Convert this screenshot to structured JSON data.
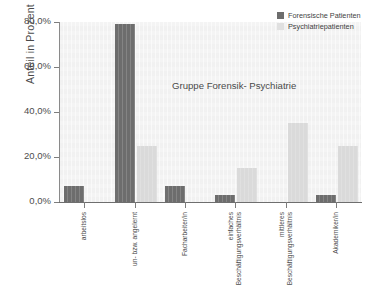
{
  "chart_data": {
    "type": "bar",
    "title": "Gruppe Forensik- Psychiatrie",
    "xlabel": "",
    "ylabel": "Anteil in Prozent",
    "ylim": [
      0,
      80
    ],
    "grid": false,
    "legend_position": "top-right",
    "ytick_labels": [
      "0,0%",
      "20,0%",
      "40,0%",
      "60,0%",
      "80,0%"
    ],
    "ytick_values": [
      0,
      20,
      40,
      60,
      80
    ],
    "categories": [
      "arbeitslos",
      "un- bzw. angelernt",
      "Facharbeiter/in",
      "einfaches Beschäftigungsverhältnis",
      "mittleres Beschäftigungsverhältnis",
      "Akademiker/in"
    ],
    "series": [
      {
        "name": "Forensische Patienten",
        "color": "#6d6d6d",
        "values": [
          7,
          79,
          7,
          3,
          0,
          3
        ]
      },
      {
        "name": "Psychiatriepatienten",
        "color": "#dadada",
        "values": [
          0,
          25,
          0,
          15,
          35,
          25
        ]
      }
    ]
  },
  "legend": {
    "items": [
      {
        "label": "Forensische Patienten",
        "color": "#6d6d6d"
      },
      {
        "label": "Psychiatriepatienten",
        "color": "#e0e0e0"
      }
    ]
  },
  "colors": {
    "forensic": "#6d6d6d",
    "psychiatric": "#dadada",
    "plot_background": "#f4f4f4",
    "axis": "#7d7d7d",
    "text": "#4a4a4a"
  }
}
